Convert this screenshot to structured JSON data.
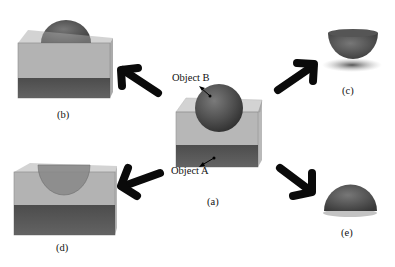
{
  "figure": {
    "panels": [
      {
        "id": "a",
        "label": "(a)",
        "description": "Sphere (Object B) intersecting transparent box (Object A)"
      },
      {
        "id": "b",
        "label": "(b)",
        "description": "Box with dome of sphere protruding above"
      },
      {
        "id": "c",
        "label": "(c)",
        "description": "Lower hemisphere bowl (sphere portion inside box)"
      },
      {
        "id": "d",
        "label": "(d)",
        "description": "Box with hemispherical cavity"
      },
      {
        "id": "e",
        "label": "(e)",
        "description": "Upper dome (sphere portion outside box)"
      }
    ],
    "annotations": {
      "object_b": "Object B",
      "object_a": "Object A"
    },
    "colors": {
      "box_face": "#9a9a9a",
      "box_floor": "#4a4a4a",
      "sphere": "#5c5c5c",
      "arrow": "#0a0a0a"
    }
  }
}
